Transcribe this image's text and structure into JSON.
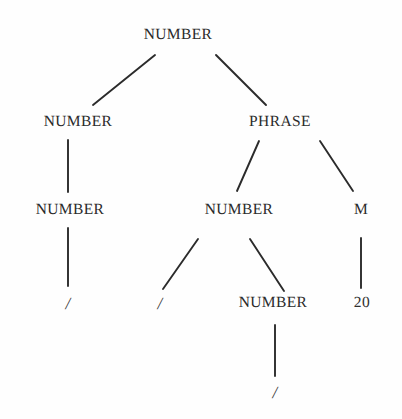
{
  "figure": {
    "kind": "syntax-parse-tree",
    "background_color": "#fefefe",
    "text_color": "#2b2b2b",
    "edge_color": "#2b2b2b"
  },
  "nodes": [
    {
      "id": "n0",
      "label": "NUMBER",
      "kind": "nonterminal",
      "x": 178,
      "y": 35,
      "depth": 0
    },
    {
      "id": "n1",
      "label": "NUMBER",
      "kind": "nonterminal",
      "x": 78,
      "y": 122,
      "depth": 1
    },
    {
      "id": "n2",
      "label": "PHRASE",
      "kind": "nonterminal",
      "x": 280,
      "y": 122,
      "depth": 1
    },
    {
      "id": "n3",
      "label": "NUMBER",
      "kind": "nonterminal",
      "x": 70,
      "y": 210,
      "depth": 2
    },
    {
      "id": "n4",
      "label": "NUMBER",
      "kind": "nonterminal",
      "x": 239,
      "y": 210,
      "depth": 2
    },
    {
      "id": "n5",
      "label": "M",
      "kind": "nonterminal",
      "x": 361,
      "y": 210,
      "depth": 2
    },
    {
      "id": "n6",
      "label": "/",
      "kind": "terminal",
      "x": 68,
      "y": 303,
      "depth": 3
    },
    {
      "id": "n7",
      "label": "/",
      "kind": "terminal",
      "x": 160,
      "y": 303,
      "depth": 3
    },
    {
      "id": "n8",
      "label": "NUMBER",
      "kind": "nonterminal",
      "x": 273,
      "y": 303,
      "depth": 3
    },
    {
      "id": "n9",
      "label": "20",
      "kind": "terminal",
      "x": 362,
      "y": 303,
      "depth": 3
    },
    {
      "id": "n10",
      "label": "/",
      "kind": "terminal",
      "x": 275,
      "y": 392,
      "depth": 4
    }
  ],
  "edges": [
    {
      "from": "n0",
      "to": "n1",
      "x1": 155,
      "y1": 55,
      "x2": 93,
      "y2": 105
    },
    {
      "from": "n0",
      "to": "n2",
      "x1": 216,
      "y1": 55,
      "x2": 266,
      "y2": 105
    },
    {
      "from": "n1",
      "to": "n3",
      "x1": 68,
      "y1": 140,
      "x2": 68,
      "y2": 192
    },
    {
      "from": "n2",
      "to": "n4",
      "x1": 259,
      "y1": 141,
      "x2": 237,
      "y2": 191
    },
    {
      "from": "n2",
      "to": "n5",
      "x1": 320,
      "y1": 141,
      "x2": 353,
      "y2": 191
    },
    {
      "from": "n3",
      "to": "n6",
      "x1": 68,
      "y1": 228,
      "x2": 68,
      "y2": 286
    },
    {
      "from": "n4",
      "to": "n7",
      "x1": 198,
      "y1": 239,
      "x2": 163,
      "y2": 289
    },
    {
      "from": "n4",
      "to": "n8",
      "x1": 250,
      "y1": 239,
      "x2": 284,
      "y2": 291
    },
    {
      "from": "n5",
      "to": "n9",
      "x1": 361,
      "y1": 238,
      "x2": 361,
      "y2": 288
    },
    {
      "from": "n8",
      "to": "n10",
      "x1": 275,
      "y1": 325,
      "x2": 275,
      "y2": 376
    }
  ]
}
